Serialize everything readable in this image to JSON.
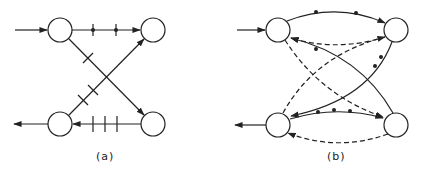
{
  "figure": {
    "panels": [
      {
        "id": "a",
        "caption": "(a)",
        "nodes": [
          {
            "id": "a1",
            "cx": 60,
            "cy": 30
          },
          {
            "id": "a2",
            "cx": 153,
            "cy": 30
          },
          {
            "id": "a3",
            "cx": 60,
            "cy": 124
          },
          {
            "id": "a4",
            "cx": 153,
            "cy": 124
          }
        ],
        "edges": [
          {
            "from": "input",
            "to": "a1",
            "style": "solid",
            "marks": "none"
          },
          {
            "from": "a1",
            "to": "a2",
            "style": "solid",
            "marks": "2 dotted ticks"
          },
          {
            "from": "a1",
            "to": "a4",
            "style": "solid",
            "marks": "1 tick"
          },
          {
            "from": "a3",
            "to": "a2",
            "style": "solid",
            "marks": "2 ticks"
          },
          {
            "from": "a4",
            "to": "a3",
            "style": "solid",
            "marks": "3 ticks"
          },
          {
            "from": "a3",
            "to": "output",
            "style": "solid",
            "marks": "none"
          }
        ]
      },
      {
        "id": "b",
        "caption": "(b)",
        "nodes": [
          {
            "id": "b1",
            "cx": 278,
            "cy": 30
          },
          {
            "id": "b2",
            "cx": 396,
            "cy": 30
          },
          {
            "id": "b3",
            "cx": 278,
            "cy": 125
          },
          {
            "id": "b4",
            "cx": 396,
            "cy": 125
          }
        ],
        "edges": [
          {
            "from": "input",
            "to": "b1",
            "style": "solid",
            "marks": "none"
          },
          {
            "from": "b1",
            "to": "b2",
            "style": "solid",
            "marks": "2 dots"
          },
          {
            "from": "b2",
            "to": "b1",
            "style": "dashed",
            "marks": "none"
          },
          {
            "from": "b4",
            "to": "b1",
            "style": "solid",
            "marks": "1 dot"
          },
          {
            "from": "b1",
            "to": "b4",
            "style": "dashed",
            "marks": "none"
          },
          {
            "from": "b3",
            "to": "b2",
            "style": "dashed",
            "marks": "none"
          },
          {
            "from": "b2",
            "to": "b3",
            "style": "solid",
            "marks": "2 dots"
          },
          {
            "from": "b3",
            "to": "b4",
            "style": "solid",
            "marks": "3 dots"
          },
          {
            "from": "b4",
            "to": "b3",
            "style": "dashed",
            "marks": "none"
          },
          {
            "from": "b3",
            "to": "output",
            "style": "solid",
            "marks": "none"
          }
        ]
      }
    ],
    "colors": {
      "ink": "#222222",
      "background": "#ffffff"
    }
  }
}
